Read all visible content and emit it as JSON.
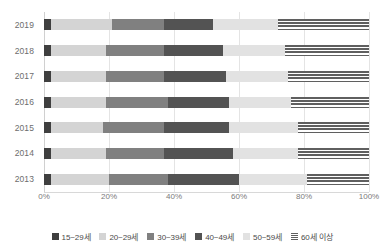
{
  "chart_data": {
    "type": "bar",
    "orientation": "horizontal",
    "stacked": true,
    "normalized_percent": true,
    "title": "",
    "xlabel": "",
    "ylabel": "",
    "xlim": [
      0,
      100
    ],
    "grid": true,
    "legend_position": "bottom",
    "xticks": [
      "0%",
      "20%",
      "40%",
      "60%",
      "80%",
      "100%"
    ],
    "xtick_values": [
      0,
      20,
      40,
      60,
      80,
      100
    ],
    "categories": [
      "2019",
      "2018",
      "2017",
      "2016",
      "2015",
      "2014",
      "2013"
    ],
    "series": [
      {
        "name": "15~29세",
        "color": "#3f3f3f",
        "pattern": "solid",
        "values": [
          2,
          2,
          2,
          2,
          2,
          2,
          2
        ]
      },
      {
        "name": "20~29세",
        "color": "#d4d4d4",
        "pattern": "solid",
        "values": [
          19,
          17,
          17,
          17,
          16,
          17,
          18
        ]
      },
      {
        "name": "30~39세",
        "color": "#808080",
        "pattern": "solid",
        "values": [
          16,
          18,
          18,
          19,
          19,
          18,
          18
        ]
      },
      {
        "name": "40~49세",
        "color": "#535353",
        "pattern": "solid",
        "values": [
          15,
          18,
          19,
          19,
          20,
          21,
          22
        ]
      },
      {
        "name": "50~59세",
        "color": "#e2e2e2",
        "pattern": "solid",
        "values": [
          20,
          19,
          19,
          19,
          21,
          20,
          21
        ]
      },
      {
        "name": "60세 이상",
        "color": "#5f5f5f",
        "pattern": "striped",
        "values": [
          28,
          26,
          25,
          24,
          22,
          22,
          19
        ]
      }
    ]
  },
  "axis": {
    "x_ticks": [
      {
        "label": "0%",
        "value": 0
      },
      {
        "label": "20%",
        "value": 20
      },
      {
        "label": "40%",
        "value": 40
      },
      {
        "label": "60%",
        "value": 60
      },
      {
        "label": "80%",
        "value": 80
      },
      {
        "label": "100%",
        "value": 100
      }
    ],
    "y_labels": [
      "2019",
      "2018",
      "2017",
      "2016",
      "2015",
      "2014",
      "2013"
    ]
  },
  "legend": {
    "items": [
      {
        "label": "15~29세",
        "color": "#3f3f3f",
        "pattern": "solid"
      },
      {
        "label": "20~29세",
        "color": "#d4d4d4",
        "pattern": "solid"
      },
      {
        "label": "30~39세",
        "color": "#808080",
        "pattern": "solid"
      },
      {
        "label": "40~49세",
        "color": "#535353",
        "pattern": "solid"
      },
      {
        "label": "50~59세",
        "color": "#e2e2e2",
        "pattern": "solid"
      },
      {
        "label": "60세 이상",
        "color": "#5f5f5f",
        "pattern": "striped"
      }
    ]
  },
  "colors": {
    "grid": "#e4e4e4",
    "axis_text": "#7a7a7a",
    "background": "#ffffff"
  }
}
